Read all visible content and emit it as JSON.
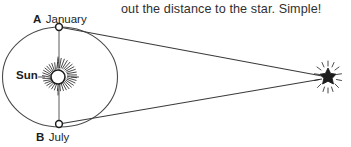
{
  "caption": {
    "text": "out the distance to the star. Simple!"
  },
  "diagram": {
    "orbit": {
      "name": "earth-orbit-ellipse",
      "cx": 60,
      "cy": 77,
      "rx": 58,
      "ry": 50
    },
    "sun": {
      "label": "Sun",
      "cx": 58,
      "cy": 77,
      "r": 7,
      "ray_count": 40
    },
    "positions": [
      {
        "id": "A",
        "point_label": "A",
        "month_label": "January",
        "x": 59,
        "y": 27
      },
      {
        "id": "B",
        "point_label": "B",
        "month_label": "July",
        "x": 59,
        "y": 124
      }
    ],
    "star": {
      "name": "distant-star",
      "cx": 328,
      "cy": 77,
      "r": 5,
      "spike_count": 8
    },
    "sight_lines": [
      {
        "from": "A",
        "x1": 59,
        "y1": 27,
        "x2": 322,
        "y2": 76
      },
      {
        "from": "B",
        "x1": 59,
        "y1": 124,
        "x2": 322,
        "y2": 79
      }
    ],
    "baseline": {
      "x1": 59,
      "y1": 27,
      "x2": 59,
      "y2": 124
    },
    "colors": {
      "ink": "#2b2b2b",
      "line": "#4a4a4a",
      "text": "#1d1d1d",
      "caption": "#2f2f2f",
      "background": "#ffffff"
    }
  }
}
